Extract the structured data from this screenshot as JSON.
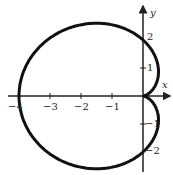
{
  "chart_data": {
    "type": "line",
    "title": "",
    "equation": "r = 2 - 2cos(theta)",
    "xlabel": "x",
    "ylabel": "y",
    "xlim": [
      -4,
      1
    ],
    "ylim": [
      -2.5,
      2.5
    ],
    "x_ticks": [
      "-4",
      "-3",
      "-2",
      "-1"
    ],
    "y_ticks": [
      "2",
      "1",
      "-1",
      "-2"
    ],
    "grid": false
  },
  "labels": {
    "x": "x",
    "y": "y",
    "xm4": "−4",
    "xm3": "−3",
    "xm2": "−2",
    "xm1": "−1",
    "y2": "2",
    "y1": "1",
    "ym1": "−1",
    "ym2": "−2"
  }
}
